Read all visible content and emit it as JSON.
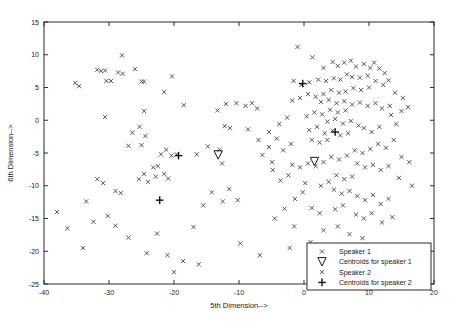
{
  "chart_data": {
    "type": "scatter",
    "title": "",
    "xlabel": "5th Dimension-->",
    "ylabel": "6th Dimension-->",
    "xlim": [
      -40,
      20
    ],
    "ylim": [
      -25,
      15
    ],
    "xticks": [
      -40,
      -30,
      -20,
      -10,
      0,
      10,
      20
    ],
    "yticks": [
      -25,
      -20,
      -15,
      -10,
      -5,
      0,
      5,
      10,
      15
    ],
    "xtick_labels": [
      "-40",
      "-30",
      "-20",
      "-10",
      "0",
      "10",
      "20"
    ],
    "ytick_labels": [
      "-25",
      "-20",
      "-15",
      "-10",
      "-5",
      "0",
      "5",
      "10",
      "15"
    ],
    "grid": false,
    "legend_position": "lower right",
    "series": [
      {
        "name": "Speaker 1",
        "marker": "x",
        "color": "#3a3a3a",
        "points": [
          [
            -28.0,
            9.9
          ],
          [
            -31.8,
            7.7
          ],
          [
            -31.2,
            7.5
          ],
          [
            -30.6,
            7.6
          ],
          [
            -28.6,
            7.3
          ],
          [
            -27.9,
            7.1
          ],
          [
            -26.0,
            7.8
          ],
          [
            -30.4,
            6.0
          ],
          [
            -29.7,
            6.0
          ],
          [
            -25.0,
            5.9
          ],
          [
            -24.6,
            5.9
          ],
          [
            -35.2,
            5.7
          ],
          [
            -34.6,
            5.2
          ],
          [
            -20.3,
            6.7
          ],
          [
            -21.5,
            4.3
          ],
          [
            -30.6,
            0.5
          ],
          [
            -24.6,
            1.4
          ],
          [
            -18.5,
            2.3
          ],
          [
            -25.3,
            -1.0
          ],
          [
            -26.4,
            -1.9
          ],
          [
            -24.4,
            -2.4
          ],
          [
            -27.0,
            -3.9
          ],
          [
            -25.0,
            -3.8
          ],
          [
            -21.2,
            -4.5
          ],
          [
            -22.0,
            -5.2
          ],
          [
            -20.4,
            -5.4
          ],
          [
            -19.6,
            -5.2
          ],
          [
            -22.5,
            -7.0
          ],
          [
            -23.2,
            -7.2
          ],
          [
            -21.5,
            -8.2
          ],
          [
            -22.8,
            -8.6
          ],
          [
            -20.9,
            -8.9
          ],
          [
            -24.6,
            -8.2
          ],
          [
            -25.4,
            -9.0
          ],
          [
            -24.0,
            -9.4
          ],
          [
            -31.8,
            -9.0
          ],
          [
            -30.9,
            -9.6
          ],
          [
            -29.0,
            -10.8
          ],
          [
            -28.2,
            -11.1
          ],
          [
            -33.5,
            -12.4
          ],
          [
            -32.4,
            -15.5
          ],
          [
            -30.2,
            -14.6
          ],
          [
            -29.0,
            -16.1
          ],
          [
            -27.0,
            -17.9
          ],
          [
            -24.2,
            -20.3
          ],
          [
            -22.6,
            -17.3
          ],
          [
            -21.0,
            -20.6
          ],
          [
            -18.6,
            -21.5
          ],
          [
            -17.0,
            -16.3
          ],
          [
            -15.5,
            -13.0
          ],
          [
            -14.2,
            -11.0
          ],
          [
            -12.5,
            -12.4
          ],
          [
            -11.5,
            -10.5
          ],
          [
            -10.2,
            -12.2
          ],
          [
            -16.5,
            -5.2
          ],
          [
            -14.8,
            -4.0
          ],
          [
            -13.0,
            -4.5
          ],
          [
            -12.6,
            -6.6
          ],
          [
            -12.2,
            -0.9
          ],
          [
            -11.4,
            -1.2
          ],
          [
            -13.3,
            1.5
          ],
          [
            -12.0,
            2.5
          ],
          [
            -10.4,
            2.6
          ],
          [
            -9.0,
            2.2
          ],
          [
            -8.0,
            2.6
          ],
          [
            -7.2,
            1.8
          ],
          [
            -8.6,
            -1.4
          ],
          [
            -7.0,
            -3.0
          ],
          [
            -6.4,
            -5.3
          ],
          [
            -5.4,
            -4.1
          ],
          [
            -4.9,
            -6.4
          ],
          [
            -16.2,
            -22.0
          ],
          [
            -9.8,
            -18.8
          ],
          [
            -6.8,
            -20.6
          ],
          [
            -38.0,
            -14.0
          ],
          [
            -36.4,
            -16.5
          ],
          [
            -34.0,
            -19.5
          ],
          [
            -20.0,
            -23.2
          ]
        ]
      },
      {
        "name": "Centroids for speaker 1",
        "marker": "triangle-down",
        "color": "#1a1a1a",
        "points": [
          [
            -13.2,
            -5.3
          ],
          [
            1.6,
            -6.3
          ]
        ]
      },
      {
        "name": "Speaker 2",
        "marker": "x",
        "color": "#3a3a3a",
        "points": [
          [
            -1.0,
            11.2
          ],
          [
            1.3,
            9.6
          ],
          [
            3.0,
            8.0
          ],
          [
            4.4,
            8.9
          ],
          [
            5.2,
            8.3
          ],
          [
            6.2,
            8.8
          ],
          [
            7.2,
            9.1
          ],
          [
            8.0,
            8.2
          ],
          [
            9.2,
            8.6
          ],
          [
            10.2,
            8.0
          ],
          [
            10.8,
            8.8
          ],
          [
            11.6,
            7.9
          ],
          [
            12.4,
            7.2
          ],
          [
            9.8,
            6.8
          ],
          [
            8.6,
            6.5
          ],
          [
            7.4,
            6.6
          ],
          [
            6.6,
            7.0
          ],
          [
            5.6,
            6.2
          ],
          [
            4.6,
            6.4
          ],
          [
            3.4,
            6.0
          ],
          [
            2.2,
            6.2
          ],
          [
            0.8,
            5.8
          ],
          [
            -0.4,
            5.4
          ],
          [
            -1.6,
            6.0
          ],
          [
            11.0,
            6.0
          ],
          [
            12.2,
            5.4
          ],
          [
            13.0,
            6.1
          ],
          [
            10.0,
            5.0
          ],
          [
            8.8,
            4.6
          ],
          [
            7.6,
            4.9
          ],
          [
            6.4,
            4.4
          ],
          [
            5.4,
            4.2
          ],
          [
            4.2,
            4.6
          ],
          [
            3.0,
            4.0
          ],
          [
            1.8,
            3.6
          ],
          [
            0.6,
            4.0
          ],
          [
            -0.6,
            3.4
          ],
          [
            -1.8,
            3.0
          ],
          [
            2.6,
            2.8
          ],
          [
            3.8,
            3.1
          ],
          [
            5.0,
            2.6
          ],
          [
            6.2,
            2.9
          ],
          [
            7.4,
            2.4
          ],
          [
            8.6,
            2.7
          ],
          [
            9.8,
            2.2
          ],
          [
            11.0,
            2.6
          ],
          [
            12.0,
            1.8
          ],
          [
            13.2,
            2.2
          ],
          [
            4.0,
            1.6
          ],
          [
            5.2,
            1.2
          ],
          [
            6.4,
            1.5
          ],
          [
            2.8,
            0.9
          ],
          [
            1.6,
            1.2
          ],
          [
            0.4,
            0.6
          ],
          [
            3.6,
            -0.2
          ],
          [
            4.8,
            0.2
          ],
          [
            6.0,
            -0.5
          ],
          [
            7.2,
            -0.1
          ],
          [
            8.4,
            -0.8
          ],
          [
            2.0,
            -1.0
          ],
          [
            0.8,
            -1.5
          ],
          [
            3.2,
            -2.0
          ],
          [
            4.4,
            -1.6
          ],
          [
            5.6,
            -2.3
          ],
          [
            6.8,
            -2.0
          ],
          [
            1.2,
            -3.0
          ],
          [
            2.4,
            -3.4
          ],
          [
            3.6,
            -3.0
          ],
          [
            9.2,
            -1.2
          ],
          [
            10.4,
            -1.8
          ],
          [
            11.6,
            -1.0
          ],
          [
            14.2,
            -0.6
          ],
          [
            13.4,
            0.8
          ],
          [
            15.0,
            1.4
          ],
          [
            14.0,
            4.2
          ],
          [
            15.2,
            3.4
          ],
          [
            16.0,
            2.0
          ],
          [
            13.8,
            -3.0
          ],
          [
            12.6,
            -4.2
          ],
          [
            11.4,
            -3.6
          ],
          [
            10.2,
            -4.4
          ],
          [
            9.0,
            -5.0
          ],
          [
            7.8,
            -4.6
          ],
          [
            6.6,
            -5.4
          ],
          [
            5.4,
            -6.0
          ],
          [
            4.2,
            -5.6
          ],
          [
            3.0,
            -6.4
          ],
          [
            1.8,
            -7.0
          ],
          [
            0.6,
            -6.6
          ],
          [
            -0.6,
            -7.2
          ],
          [
            -1.8,
            -6.8
          ],
          [
            8.2,
            -6.6
          ],
          [
            9.4,
            -7.2
          ],
          [
            10.6,
            -6.8
          ],
          [
            11.8,
            -7.6
          ],
          [
            13.0,
            -7.0
          ],
          [
            5.0,
            -8.4
          ],
          [
            6.2,
            -9.0
          ],
          [
            7.4,
            -8.6
          ],
          [
            3.8,
            -9.4
          ],
          [
            2.6,
            -10.0
          ],
          [
            4.6,
            -10.6
          ],
          [
            5.8,
            -11.2
          ],
          [
            7.0,
            -10.8
          ],
          [
            8.2,
            -11.6
          ],
          [
            9.4,
            -12.2
          ],
          [
            10.6,
            -11.4
          ],
          [
            11.8,
            -12.8
          ],
          [
            13.0,
            -12.0
          ],
          [
            6.0,
            -13.0
          ],
          [
            4.8,
            -13.6
          ],
          [
            2.4,
            -14.2
          ],
          [
            1.2,
            -13.4
          ],
          [
            8.0,
            -14.4
          ],
          [
            9.2,
            -15.0
          ],
          [
            10.4,
            -14.2
          ],
          [
            12.0,
            -15.6
          ],
          [
            13.6,
            -14.8
          ],
          [
            5.2,
            -16.2
          ],
          [
            3.0,
            -16.8
          ],
          [
            7.0,
            -17.4
          ],
          [
            9.0,
            -18.0
          ],
          [
            1.0,
            -18.6
          ],
          [
            -1.5,
            -16.2
          ],
          [
            -3.0,
            -13.5
          ],
          [
            -4.5,
            -15.0
          ],
          [
            -2.2,
            -19.5
          ],
          [
            4.0,
            -20.5
          ],
          [
            15.0,
            -5.6
          ],
          [
            16.2,
            -6.4
          ],
          [
            14.6,
            -8.8
          ],
          [
            16.6,
            -10.0
          ],
          [
            -3.6,
            -9.2
          ],
          [
            -2.4,
            -8.4
          ],
          [
            -4.8,
            -7.6
          ],
          [
            -0.2,
            -11.0
          ],
          [
            -1.4,
            -12.0
          ],
          [
            0.2,
            -9.6
          ],
          [
            -3.2,
            -4.6
          ],
          [
            -2.0,
            -3.6
          ],
          [
            -4.2,
            -2.8
          ],
          [
            -5.4,
            -1.8
          ],
          [
            -3.8,
            -0.6
          ],
          [
            -2.6,
            0.4
          ]
        ]
      },
      {
        "name": "Centroids for speaker 2",
        "marker": "plus",
        "color": "#111111",
        "points": [
          [
            -19.3,
            -5.4
          ],
          [
            -22.2,
            -12.2
          ],
          [
            4.8,
            -1.8
          ],
          [
            -0.2,
            5.6
          ]
        ]
      }
    ]
  },
  "legend": {
    "entries": [
      {
        "label": "Speaker 1",
        "marker": "x"
      },
      {
        "label": "Centroids for speaker 1",
        "marker": "triangle-down"
      },
      {
        "label": "Speaker 2",
        "marker": "x"
      },
      {
        "label": "Centroids for speaker 2",
        "marker": "plus"
      }
    ]
  }
}
